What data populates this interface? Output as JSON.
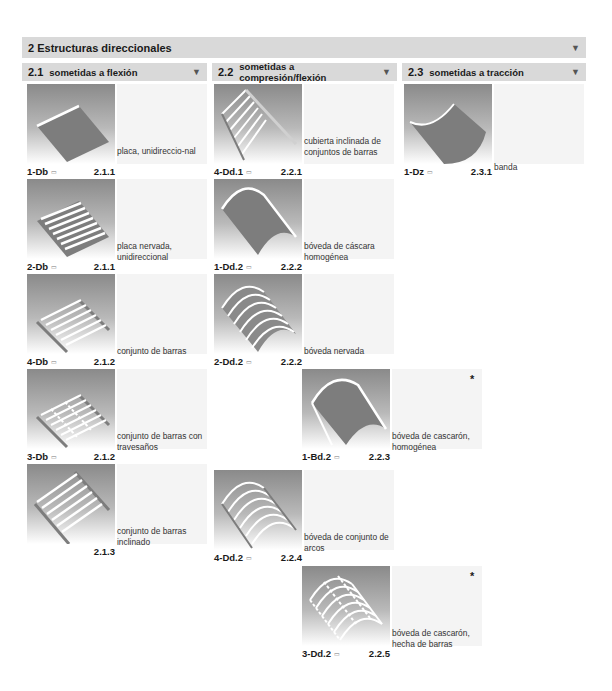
{
  "header": {
    "title": "2  Estructuras direccionales",
    "toggle_icon": "▼"
  },
  "columns": [
    {
      "num": "2.1",
      "label": "sometidas a flexión",
      "toggle_icon": "▼"
    },
    {
      "num": "2.2",
      "label": "sometidas a compresión/flexión",
      "toggle_icon": "▼"
    },
    {
      "num": "2.3",
      "label": "sometidas a tracción",
      "toggle_icon": "▼"
    }
  ],
  "book_icon": "▭",
  "cells": [
    {
      "code": "1-Db",
      "ref": "2.1.1",
      "desc": "placa, unidireccio-nal",
      "starred": false
    },
    {
      "code": "2-Db",
      "ref": "2.1.1",
      "desc": "placa nervada, unidireccional",
      "starred": false
    },
    {
      "code": "4-Db",
      "ref": "2.1.2",
      "desc": "conjunto de barras",
      "starred": false
    },
    {
      "code": "3-Db",
      "ref": "2.1.2",
      "desc": "conjunto de barras con travesaños",
      "starred": false
    },
    {
      "code": "",
      "ref": "2.1.3",
      "desc": "conjunto de barras inclinado",
      "starred": false
    },
    {
      "code": "4-Dd.1",
      "ref": "2.2.1",
      "desc": "cubierta inclinada de conjuntos de barras",
      "starred": false
    },
    {
      "code": "1-Dd.2",
      "ref": "2.2.2",
      "desc": "bóveda de cáscara homogénea",
      "starred": false
    },
    {
      "code": "2-Dd.2",
      "ref": "2.2.2",
      "desc": "bóveda nervada",
      "starred": false
    },
    {
      "code": "1-Bd.2",
      "ref": "2.2.3",
      "desc": "bóveda de cascarón, homogénea",
      "starred": true,
      "star": "*"
    },
    {
      "code": "4-Dd.2",
      "ref": "2.2.4",
      "desc": "bóveda de conjunto de arcos",
      "starred": false
    },
    {
      "code": "3-Dd.2",
      "ref": "2.2.5",
      "desc": "bóveda de cascarón, hecha de barras",
      "starred": true,
      "star": "*"
    },
    {
      "code": "1-Dz",
      "ref": "2.3.1",
      "desc": "banda",
      "starred": false
    }
  ]
}
